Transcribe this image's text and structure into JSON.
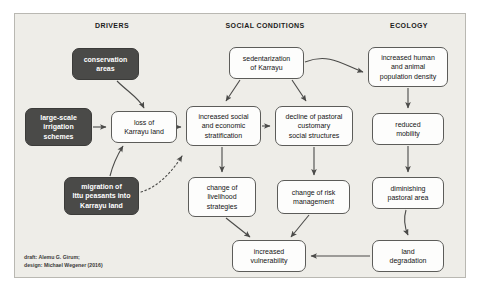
{
  "diagram": {
    "background_color": "#eeede8",
    "frame_border_color": "#b9b8b2",
    "dark_node_color": "#4a4a48",
    "light_node_color": "#fdfdfc",
    "arrow_color": "#4a4a48",
    "columns": [
      {
        "id": "drivers",
        "label": "DRIVERS",
        "x": 112
      },
      {
        "id": "social-conditions",
        "label": "SOCIAL CONDITIONS",
        "x": 265
      },
      {
        "id": "ecology",
        "label": "ECOLOGY",
        "x": 409
      }
    ],
    "nodes": [
      {
        "id": "conservation-areas",
        "label": "conservation\nareas",
        "style": "dark",
        "x": 72,
        "y": 48,
        "w": 67,
        "h": 32
      },
      {
        "id": "large-scale-irrigation-schemes",
        "label": "large-scale\nirrigation\nschemes",
        "style": "dark",
        "x": 25,
        "y": 108,
        "w": 67,
        "h": 38
      },
      {
        "id": "migration-of-ittu-peasants",
        "label": "migration of\nIttu peasants into\nKarrayu land",
        "style": "dark",
        "x": 64,
        "y": 177,
        "w": 75,
        "h": 38
      },
      {
        "id": "loss-of-karrayu-land",
        "label": "loss of\nKarrayu land",
        "style": "light",
        "x": 111,
        "y": 111,
        "w": 66,
        "h": 32
      },
      {
        "id": "sedentarization-of-karrayu",
        "label": "sedentarization\nof Karrayu",
        "style": "light",
        "x": 229,
        "y": 47,
        "w": 75,
        "h": 32
      },
      {
        "id": "increased-social-stratification",
        "label": "increased social\nand economic\nstratification",
        "style": "light",
        "x": 186,
        "y": 106,
        "w": 75,
        "h": 40
      },
      {
        "id": "decline-of-pastoral-structures",
        "label": "decline of pastoral\ncustomary\nsocial structures",
        "style": "light",
        "x": 275,
        "y": 106,
        "w": 78,
        "h": 40
      },
      {
        "id": "change-of-livelihood-strategies",
        "label": "change of\nlivelihood\nstrategies",
        "style": "light",
        "x": 188,
        "y": 177,
        "w": 68,
        "h": 40
      },
      {
        "id": "change-of-risk-management",
        "label": "change of risk\nmanagement",
        "style": "light",
        "x": 277,
        "y": 180,
        "w": 73,
        "h": 34
      },
      {
        "id": "increased-vulnerability",
        "label": "increased\nvulnerability",
        "style": "light",
        "x": 232,
        "y": 240,
        "w": 74,
        "h": 32
      },
      {
        "id": "increased-human-animal-population-density",
        "label": "increased human\nand animal\npopulation density",
        "style": "light",
        "x": 368,
        "y": 47,
        "w": 80,
        "h": 40
      },
      {
        "id": "reduced-mobility",
        "label": "reduced\nmobility",
        "style": "light",
        "x": 372,
        "y": 113,
        "w": 72,
        "h": 32
      },
      {
        "id": "diminishing-pastoral-area",
        "label": "diminishing\npastoral area",
        "style": "light",
        "x": 372,
        "y": 177,
        "w": 72,
        "h": 32
      },
      {
        "id": "land-degradation",
        "label": "land\ndegradation",
        "style": "light",
        "x": 372,
        "y": 240,
        "w": 72,
        "h": 32
      }
    ],
    "edges": [
      {
        "id": "conservation-to-loss",
        "from": "conservation-areas",
        "to": "loss-of-karrayu-land",
        "style": "curved"
      },
      {
        "id": "irrigation-to-loss",
        "from": "large-scale-irrigation-schemes",
        "to": "loss-of-karrayu-land",
        "style": "straight"
      },
      {
        "id": "migration-to-loss",
        "from": "migration-of-ittu-peasants",
        "to": "loss-of-karrayu-land",
        "style": "curved"
      },
      {
        "id": "migration-to-stratification",
        "from": "migration-of-ittu-peasants",
        "to": "increased-social-stratification",
        "style": "dotted"
      },
      {
        "id": "loss-to-stratification",
        "from": "loss-of-karrayu-land",
        "to": "increased-social-stratification",
        "style": "straight"
      },
      {
        "id": "sedentarization-to-stratification",
        "from": "sedentarization-of-karrayu",
        "to": "increased-social-stratification",
        "style": "straight"
      },
      {
        "id": "sedentarization-to-decline",
        "from": "sedentarization-of-karrayu",
        "to": "decline-of-pastoral-structures",
        "style": "straight"
      },
      {
        "id": "sedentarization-to-population-density",
        "from": "sedentarization-of-karrayu",
        "to": "increased-human-animal-population-density",
        "style": "curved"
      },
      {
        "id": "stratification-to-decline",
        "from": "increased-social-stratification",
        "to": "decline-of-pastoral-structures",
        "style": "straight"
      },
      {
        "id": "stratification-to-livelihood",
        "from": "increased-social-stratification",
        "to": "change-of-livelihood-strategies",
        "style": "straight"
      },
      {
        "id": "decline-to-risk",
        "from": "decline-of-pastoral-structures",
        "to": "change-of-risk-management",
        "style": "straight"
      },
      {
        "id": "livelihood-to-vulnerability",
        "from": "change-of-livelihood-strategies",
        "to": "increased-vulnerability",
        "style": "straight"
      },
      {
        "id": "risk-to-vulnerability",
        "from": "change-of-risk-management",
        "to": "increased-vulnerability",
        "style": "straight"
      },
      {
        "id": "population-to-mobility",
        "from": "increased-human-animal-population-density",
        "to": "reduced-mobility",
        "style": "straight"
      },
      {
        "id": "mobility-to-pastoral-area",
        "from": "reduced-mobility",
        "to": "diminishing-pastoral-area",
        "style": "straight"
      },
      {
        "id": "pastoral-area-to-degradation",
        "from": "diminishing-pastoral-area",
        "to": "land-degradation",
        "style": "curved"
      },
      {
        "id": "degradation-to-vulnerability",
        "from": "land-degradation",
        "to": "increased-vulnerability",
        "style": "straight"
      }
    ],
    "credit": "draft: Alemu G. Girum;\ndesign: Michael Wegener (2016)"
  }
}
